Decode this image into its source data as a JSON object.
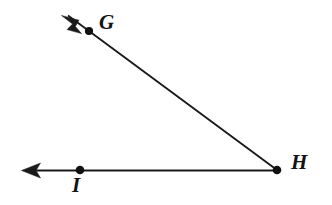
{
  "figure": {
    "width": 332,
    "height": 205,
    "background_color": "#ffffff",
    "stroke_color": "#1a1a1a"
  },
  "labels": {
    "g": "G",
    "h": "H",
    "i": "I"
  },
  "points": [
    {
      "name": "G",
      "label": "G",
      "x": 89,
      "y": 31,
      "label_x": 108,
      "label_y": 24
    },
    {
      "name": "H",
      "label": "H",
      "x": 277,
      "y": 170,
      "label_x": 300,
      "label_y": 165
    },
    {
      "name": "I",
      "label": "I",
      "x": 80,
      "y": 170,
      "label_x": 78,
      "label_y": 187
    }
  ],
  "rays": [
    {
      "name": "ray-HG",
      "from": "H",
      "through": "G",
      "start_x": 277,
      "start_y": 170,
      "end_x": 66,
      "end_y": 14,
      "arrow_tip_x": 62,
      "arrow_tip_y": 16,
      "arrow_at": "end"
    },
    {
      "name": "ray-HI",
      "from": "H",
      "through": "I",
      "start_x": 277,
      "start_y": 170,
      "end_x": 27,
      "end_y": 170,
      "arrow_tip_x": 22,
      "arrow_tip_y": 170,
      "arrow_at": "end"
    }
  ]
}
